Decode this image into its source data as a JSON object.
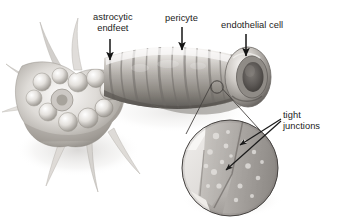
{
  "figure": {
    "background_color": "#ffffff",
    "width": 340,
    "height": 221
  },
  "labels": {
    "astrocytic_endfeet": {
      "line1": "astrocytic",
      "line2": "endfeet"
    },
    "pericyte": "pericyte",
    "endothelial_cell": "endothelial cell",
    "tight_junctions": {
      "line1": "tight",
      "line2": "junctions"
    }
  },
  "colors": {
    "text": "#1c1c1c",
    "arrow": "#141414",
    "leader_line": "#3a3a3a",
    "vessel_light": "#e8e6e3",
    "vessel_mid": "#b9b5b0",
    "vessel_dark": "#6f6b67",
    "vessel_shadow": "#4a4744",
    "astrocyte_light": "#efedea",
    "astrocyte_mid": "#c4c0ba",
    "astrocyte_dark": "#8a857f",
    "inset_fill": "#b2aeaa",
    "inset_cell_light": "#d8d5d1",
    "inset_cell_dark": "#9c9894",
    "inset_border": "#5c5955",
    "page_shadow": "#d7d5d2"
  },
  "structures": [
    {
      "name": "astrocyte",
      "description": "star-shaped glial cell with branching processes, left side"
    },
    {
      "name": "capillary",
      "description": "banded blood vessel running left to right, cut open at right end"
    },
    {
      "name": "pericyte",
      "description": "wrapping bands around the middle of the capillary"
    },
    {
      "name": "endothelial-cell",
      "description": "cell lining the vessel lumen, visible at the cut right end"
    },
    {
      "name": "magnifier-inset",
      "description": "circular magnified view of the vessel wall showing tight junctions"
    },
    {
      "name": "magnifier-source",
      "description": "small circle on the vessel marking the magnified region"
    }
  ]
}
